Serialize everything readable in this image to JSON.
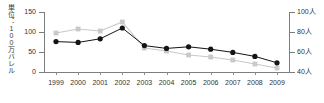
{
  "chart_data": {
    "type": "line",
    "title": "",
    "subtitle": "",
    "xlabel": "",
    "ylabel": "単位：100万バレル",
    "grid": false,
    "legend_position": "none",
    "categories": [
      "1999",
      "2000",
      "2001",
      "2002",
      "2003",
      "2004",
      "2005",
      "2006",
      "2007",
      "2008",
      "2009"
    ],
    "axes": {
      "left": {
        "label": "単位：100万バレル",
        "ticks": [
          0,
          50,
          100,
          150
        ],
        "tick_labels": [
          "0",
          "50",
          "100",
          "150"
        ],
        "ylim": [
          0,
          150
        ],
        "unit": "100万バレル"
      },
      "right": {
        "ticks": [
          40,
          60,
          80,
          100
        ],
        "tick_labels": [
          "40人",
          "60人",
          "80人",
          "100人"
        ],
        "ylim": [
          40,
          100
        ],
        "unit": "人"
      },
      "x": {
        "tick_labels": [
          "1999",
          "2000",
          "2001",
          "2002",
          "2003",
          "2004",
          "2005",
          "2006",
          "2007",
          "2008",
          "2009"
        ]
      }
    },
    "series": [
      {
        "name": "100万バレル",
        "axis": "left",
        "color": "#141414",
        "marker": "circle",
        "values": [
          76,
          74,
          83,
          110,
          66,
          59,
          63,
          57,
          49,
          39,
          23
        ]
      },
      {
        "name": "人",
        "axis": "right",
        "color": "#c9c9c9",
        "marker": "square",
        "values": [
          79,
          83,
          81,
          90,
          64,
          61,
          57,
          55,
          52,
          48,
          44
        ]
      }
    ]
  },
  "colors": {
    "series_black": "#141414",
    "series_gray": "#c9c9c9",
    "axis": "#7d7d7d",
    "text": "#333333",
    "background": "#ffffff"
  }
}
